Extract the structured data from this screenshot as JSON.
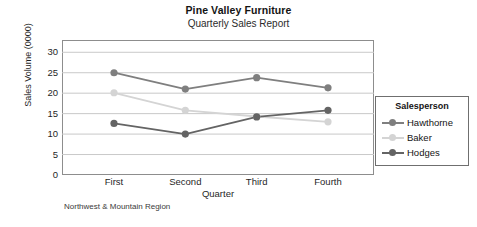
{
  "chart_data": {
    "type": "line",
    "title": "Pine Valley Furniture",
    "subtitle": "Quarterly Sales Report",
    "xlabel": "Quarter",
    "ylabel": "Sales Volume (0000)",
    "footnote": "Northwest & Mountain Region",
    "categories": [
      "First",
      "Second",
      "Third",
      "Fourth"
    ],
    "ylim": [
      0,
      33
    ],
    "yticks": [
      0,
      5,
      10,
      15,
      20,
      25,
      30
    ],
    "ytick_labels": [
      "0",
      "5",
      "10",
      "15",
      "20",
      "25",
      "30"
    ],
    "grid": true,
    "legend_position": "right-inside",
    "legend_title": "Salesperson",
    "series": [
      {
        "name": "Hawthorne",
        "values": [
          25.0,
          21.0,
          23.8,
          21.3
        ],
        "color": "#7f7f7f"
      },
      {
        "name": "Baker",
        "values": [
          20.1,
          15.8,
          14.3,
          13.0
        ],
        "color": "#d4d4d4"
      },
      {
        "name": "Hodges",
        "values": [
          12.6,
          10.0,
          14.2,
          15.8
        ],
        "color": "#646464"
      }
    ]
  },
  "colors": {
    "frame": "#8d8d8d",
    "gridline": "#c9c9c9",
    "text": "#1a1a1a",
    "legend_border": "#6f6f6f"
  }
}
